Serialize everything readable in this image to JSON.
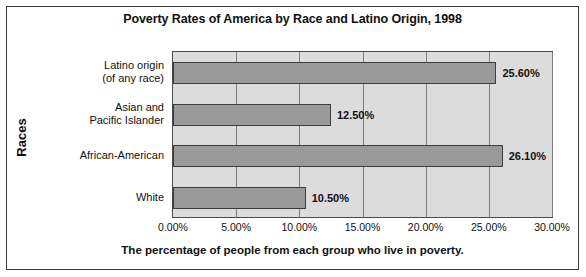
{
  "chart_data": {
    "type": "bar",
    "orientation": "horizontal",
    "title": "Poverty Rates of America by Race and Latino Origin, 1998",
    "xlabel": "The percentage of people from each group who live in poverty.",
    "ylabel": "Races",
    "categories": [
      "Latino origin\n(of any race)",
      "Asian and\nPacific Islander",
      "African-American",
      "White"
    ],
    "category_lines": [
      [
        "Latino origin",
        "(of any race)"
      ],
      [
        "Asian and",
        "Pacific Islander"
      ],
      [
        "African-American"
      ],
      [
        "White"
      ]
    ],
    "values": [
      25.6,
      12.5,
      26.1,
      10.5
    ],
    "value_labels": [
      "25.60%",
      "12.50%",
      "26.10%",
      "10.50%"
    ],
    "xlim": [
      0,
      30
    ],
    "xticks": [
      0,
      5,
      10,
      15,
      20,
      25,
      30
    ],
    "xtick_labels": [
      "0.00%",
      "5.00%",
      "10.00%",
      "15.00%",
      "20.00%",
      "25.00%",
      "30.00%"
    ],
    "grid": true,
    "legend": false,
    "colors": {
      "bar_fill": "#9a9a9a",
      "bar_border": "#3c3c3c",
      "plot_background": "#dcdcdc",
      "gridline": "#7d7d7d",
      "text": "#111111",
      "frame": "#3a3a3a"
    }
  }
}
